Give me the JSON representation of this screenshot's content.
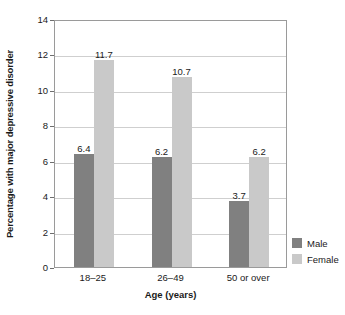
{
  "chart_data": {
    "type": "bar",
    "title": "",
    "xlabel": "Age (years)",
    "ylabel": "Percentage with major depressive disorder",
    "categories": [
      "18–25",
      "26–49",
      "50 or over"
    ],
    "series": [
      {
        "name": "Male",
        "values": [
          6.4,
          6.2,
          3.7
        ],
        "color": "#808080"
      },
      {
        "name": "Female",
        "values": [
          11.7,
          10.7,
          6.2
        ],
        "color": "#c9c9c9"
      }
    ],
    "ylim": [
      0,
      14
    ],
    "yticks": [
      0,
      2,
      4,
      6,
      8,
      10,
      12,
      14
    ],
    "ytick_labels": [
      "0",
      "2",
      "4",
      "6",
      "8",
      "10",
      "12",
      "14"
    ],
    "grid": true,
    "grid_axis": "y",
    "legend_position": "right-bottom-outside",
    "data_labels": [
      [
        "6.4",
        "11.7"
      ],
      [
        "6.2",
        "10.7"
      ],
      [
        "3.7",
        "6.2"
      ]
    ]
  },
  "legend": {
    "items": [
      {
        "label": "Male",
        "color": "#808080"
      },
      {
        "label": "Female",
        "color": "#c9c9c9"
      }
    ]
  }
}
